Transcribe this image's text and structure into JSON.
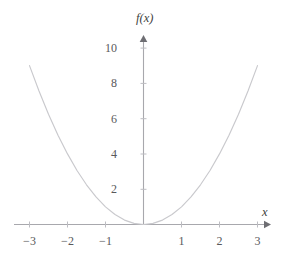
{
  "figure": {
    "background_color": "#ffffff",
    "curve_color": "#c9c9cd",
    "axis_color": "#a8a8ad",
    "tick_label_color": "#59595b",
    "axis_label_color": "#3f3f41"
  },
  "axes": {
    "x_axis_label": "x",
    "y_axis_label": "f(x)",
    "x_ticks": [
      {
        "value": -3,
        "label": "−3"
      },
      {
        "value": -2,
        "label": "−2"
      },
      {
        "value": -1,
        "label": "−1"
      },
      {
        "value": 1,
        "label": "1"
      },
      {
        "value": 2,
        "label": "2"
      },
      {
        "value": 3,
        "label": "3"
      }
    ],
    "y_ticks": [
      {
        "value": 2,
        "label": "2"
      },
      {
        "value": 4,
        "label": "4"
      },
      {
        "value": 6,
        "label": "6"
      },
      {
        "value": 8,
        "label": "8"
      },
      {
        "value": 10,
        "label": "10"
      }
    ]
  },
  "chart_data": {
    "type": "line",
    "title": "",
    "subtitle": "",
    "xlabel": "x",
    "ylabel": "f(x)",
    "xlim": [
      -3.45,
      3.45
    ],
    "ylim": [
      0,
      11.2
    ],
    "grid": false,
    "legend": null,
    "function": "f(x) = x^2",
    "series": [
      {
        "name": "f(x) = x^2",
        "color": "#c9c9cd",
        "x": [
          -3,
          -2.75,
          -2.5,
          -2.25,
          -2,
          -1.75,
          -1.5,
          -1.25,
          -1,
          -0.75,
          -0.5,
          -0.25,
          0,
          0.25,
          0.5,
          0.75,
          1,
          1.25,
          1.5,
          1.75,
          2,
          2.25,
          2.5,
          2.75,
          3
        ],
        "values": [
          9,
          7.5625,
          6.25,
          5.0625,
          4,
          3.0625,
          2.25,
          1.5625,
          1,
          0.5625,
          0.25,
          0.0625,
          0,
          0.0625,
          0.25,
          0.5625,
          1,
          1.5625,
          2.25,
          3.0625,
          4,
          5.0625,
          6.25,
          7.5625,
          9
        ]
      }
    ],
    "annotations": []
  }
}
